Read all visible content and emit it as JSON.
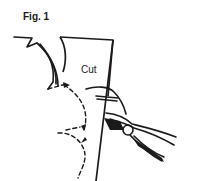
{
  "figure": {
    "label": "Fig. 1",
    "annotations": [
      {
        "id": "cut",
        "text": "Cut"
      }
    ],
    "elements": [
      "torn-edge-left",
      "sheet",
      "dashed-motion-arrows",
      "cutting-pliers"
    ],
    "colors": {
      "ink": "#1a1a1a",
      "background": "#ffffff"
    }
  }
}
